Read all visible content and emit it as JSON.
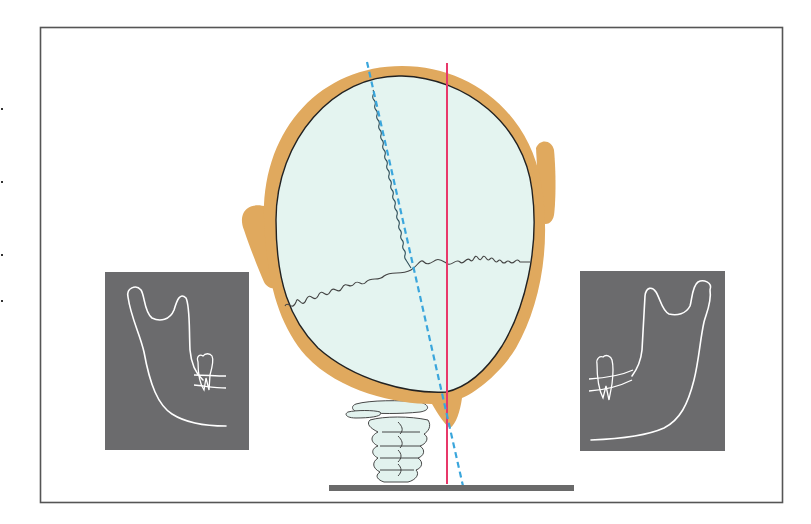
{
  "figure": {
    "colors": {
      "background": "#ffffff",
      "frame": "#555555",
      "skin": "#e0a95e",
      "skull_fill": "#e4f4f0",
      "skull_outline": "#222222",
      "vertical_reference_line": "#e8386a",
      "tilted_midline_dashed": "#3aa6dc",
      "panel_bg": "#6b6b6d",
      "panel_line": "#ffffff",
      "spine_fill": "#e2f2ee",
      "ground_bar": "#6a6a6a",
      "suture": "#444444"
    },
    "elements": {
      "head": "head-outline",
      "skull": "skull-ellipse",
      "left_ear": "ear-left",
      "right_ear": "ear-right",
      "sagittal_suture": "sagittal-suture",
      "coronal_suture": "coronal-suture",
      "vertical_line": "vertical-reference-line",
      "tilted_line": "tilted-midline",
      "cervical_spine": "cervical-spine",
      "ground": "ground-bar",
      "left_panel": "mandible-panel-left",
      "right_panel": "mandible-panel-right"
    }
  }
}
